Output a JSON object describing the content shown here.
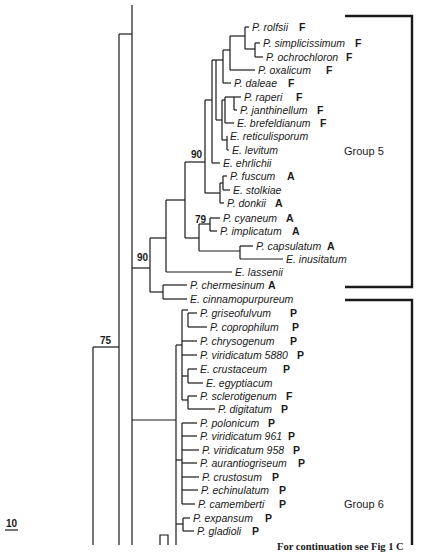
{
  "figure": {
    "scale_bar_label": "10",
    "continuation_note": "For continuation see Fig 1 C",
    "groups": [
      {
        "label": "Group 5",
        "top": 16,
        "bottom": 287,
        "label_y": 152
      },
      {
        "label": "Group 6",
        "top": 300,
        "bottom": 545,
        "label_y": 505
      }
    ],
    "bootstrap": [
      {
        "value": "90",
        "x": 203,
        "y": 155
      },
      {
        "value": "79",
        "x": 196,
        "y": 221
      },
      {
        "value": "90",
        "x": 137,
        "y": 258
      },
      {
        "value": "75",
        "x": 100,
        "y": 343
      }
    ],
    "leaves": [
      {
        "name": "P. rolfsii",
        "tag": "F",
        "x": 252,
        "y": 27,
        "tag_x": 299
      },
      {
        "name": "P. simplicissimum",
        "tag": "F",
        "x": 263,
        "y": 43,
        "tag_x": 355
      },
      {
        "name": "P. ochrochloron",
        "tag": "F",
        "x": 266,
        "y": 57,
        "tag_x": 346
      },
      {
        "name": "P. oxalicum",
        "tag": "F",
        "x": 258,
        "y": 70,
        "tag_x": 326
      },
      {
        "name": "P. daleae",
        "tag": "F",
        "x": 234,
        "y": 83,
        "tag_x": 288
      },
      {
        "name": "P. raperi",
        "tag": "F",
        "x": 244,
        "y": 97,
        "tag_x": 296
      },
      {
        "name": "P. janthinellum",
        "tag": "F",
        "x": 240,
        "y": 110,
        "tag_x": 317
      },
      {
        "name": "E. brefeldianum",
        "tag": "F",
        "x": 237,
        "y": 123,
        "tag_x": 320
      },
      {
        "name": "E. reticulisporum",
        "tag": "",
        "x": 230,
        "y": 136,
        "tag_x": 0
      },
      {
        "name": "E. levitum",
        "tag": "",
        "x": 232,
        "y": 150,
        "tag_x": 0
      },
      {
        "name": "E. ehrlichii",
        "tag": "",
        "x": 223,
        "y": 163,
        "tag_x": 0
      },
      {
        "name": "P. fuscum",
        "tag": "A",
        "x": 230,
        "y": 176,
        "tag_x": 287
      },
      {
        "name": "E. stolkiae",
        "tag": "",
        "x": 233,
        "y": 190,
        "tag_x": 0
      },
      {
        "name": "P. donkii",
        "tag": "A",
        "x": 227,
        "y": 203,
        "tag_x": 275
      },
      {
        "name": "P. cyaneum",
        "tag": "A",
        "x": 223,
        "y": 218,
        "tag_x": 286
      },
      {
        "name": "P. implicatum",
        "tag": "A",
        "x": 220,
        "y": 231,
        "tag_x": 292
      },
      {
        "name": "P. capsulatum",
        "tag": "A",
        "x": 256,
        "y": 246,
        "tag_x": 327
      },
      {
        "name": "E. inusitatum",
        "tag": "",
        "x": 286,
        "y": 259,
        "tag_x": 0
      },
      {
        "name": "E. lassenii",
        "tag": "",
        "x": 235,
        "y": 272,
        "tag_x": 0
      },
      {
        "name": "P. chermesinum",
        "tag": "A",
        "x": 190,
        "y": 285,
        "tag_x": 268
      },
      {
        "name": "E. cinnamopurpureum",
        "tag": "",
        "x": 190,
        "y": 299,
        "tag_x": 0
      },
      {
        "name": "P. griseofulvum",
        "tag": "P",
        "x": 200,
        "y": 313,
        "tag_x": 290
      },
      {
        "name": "P. coprophilum",
        "tag": "P",
        "x": 210,
        "y": 327,
        "tag_x": 292
      },
      {
        "name": "P. chrysogenum",
        "tag": "P",
        "x": 200,
        "y": 341,
        "tag_x": 290
      },
      {
        "name": "P. viridicatum 5880",
        "tag": "P",
        "x": 200,
        "y": 355,
        "tag_x": 297
      },
      {
        "name": "E. crustaceum",
        "tag": "P",
        "x": 200,
        "y": 369,
        "tag_x": 283
      },
      {
        "name": "E. egyptiacum",
        "tag": "",
        "x": 206,
        "y": 383,
        "tag_x": 0
      },
      {
        "name": "P. sclerotigenum",
        "tag": "F",
        "x": 200,
        "y": 396,
        "tag_x": 286
      },
      {
        "name": "P. digitatum",
        "tag": "P",
        "x": 218,
        "y": 409,
        "tag_x": 281
      },
      {
        "name": "P. polonicum",
        "tag": "P",
        "x": 200,
        "y": 423,
        "tag_x": 268
      },
      {
        "name": "P. viridicatum 961",
        "tag": "P",
        "x": 200,
        "y": 436,
        "tag_x": 288
      },
      {
        "name": "P. viridicatum 958",
        "tag": "P",
        "x": 202,
        "y": 450,
        "tag_x": 293
      },
      {
        "name": "P. aurantiogriseum",
        "tag": "P",
        "x": 200,
        "y": 463,
        "tag_x": 298
      },
      {
        "name": "P. crustosum",
        "tag": "P",
        "x": 202,
        "y": 477,
        "tag_x": 272
      },
      {
        "name": "P. echinulatum",
        "tag": "P",
        "x": 201,
        "y": 490,
        "tag_x": 279
      },
      {
        "name": "P. camemberti",
        "tag": "P",
        "x": 198,
        "y": 504,
        "tag_x": 279
      },
      {
        "name": "P. expansum",
        "tag": "P",
        "x": 193,
        "y": 518,
        "tag_x": 265
      },
      {
        "name": "P. gladioli",
        "tag": "P",
        "x": 197,
        "y": 531,
        "tag_x": 252
      }
    ]
  }
}
